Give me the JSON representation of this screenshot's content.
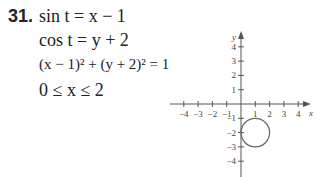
{
  "problem": {
    "number": "31.",
    "lines": [
      "sin t = x − 1",
      "cos t = y + 2",
      "(x − 1)² + (y + 2)² = 1",
      "0 ≤ x ≤ 2"
    ]
  },
  "chart_data": {
    "type": "line",
    "title": "",
    "xlabel": "x",
    "ylabel": "y",
    "xlim": [
      -4.5,
      4.5
    ],
    "ylim": [
      -4.5,
      4.5
    ],
    "x_ticks": [
      -4,
      -3,
      -2,
      -1,
      1,
      2,
      3,
      4
    ],
    "y_ticks": [
      4,
      3,
      2,
      1,
      -1,
      -2,
      -3,
      -4
    ],
    "x_tick_labels": [
      "−4",
      "−3",
      "−2",
      "−1",
      "1",
      "2",
      "3",
      "4"
    ],
    "y_tick_labels": [
      "4",
      "3",
      "2",
      "1",
      "−1",
      "−2",
      "−3",
      "−4"
    ],
    "grid": false,
    "series": [
      {
        "name": "circle (x−1)² + (y+2)² = 1",
        "center": [
          1,
          -2
        ],
        "radius": 1
      }
    ]
  }
}
